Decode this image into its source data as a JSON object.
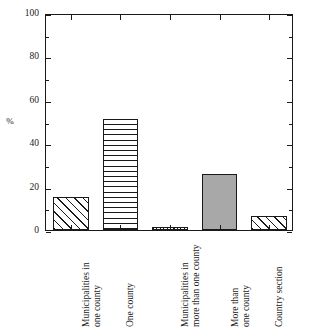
{
  "chart_data": {
    "type": "bar",
    "title": "",
    "xlabel": "",
    "ylabel": "%",
    "ylim": [
      0,
      100
    ],
    "yticks": [
      0,
      20,
      40,
      60,
      80,
      100
    ],
    "ytick_labels": [
      "0",
      "20",
      "40",
      "60",
      "80",
      "100"
    ],
    "yminor_step": 10,
    "grid": false,
    "legend": null,
    "categories": [
      "Municipalities in one county",
      "One county",
      "Municipalities in more than one county",
      "More than one county",
      "Country section"
    ],
    "category_lines": [
      [
        "Municipalities in",
        "one county"
      ],
      [
        "One county"
      ],
      [
        "Municipalities in",
        "more than one county"
      ],
      [
        "More than",
        "one county"
      ],
      [
        "Country section"
      ]
    ],
    "values": [
      15,
      51,
      1.5,
      26,
      6.5
    ],
    "bar_fills": [
      "diagonal-hatch",
      "horizontal-hatch",
      "vertical-hatch",
      "solid-gray",
      "diagonal-hatch"
    ],
    "colors": {
      "axis": "#1a1a1a",
      "hatch": "#1a1a1a",
      "solid_gray": "#a8a8a8",
      "background": "#ffffff"
    }
  },
  "axes": {
    "y_title": "%"
  }
}
